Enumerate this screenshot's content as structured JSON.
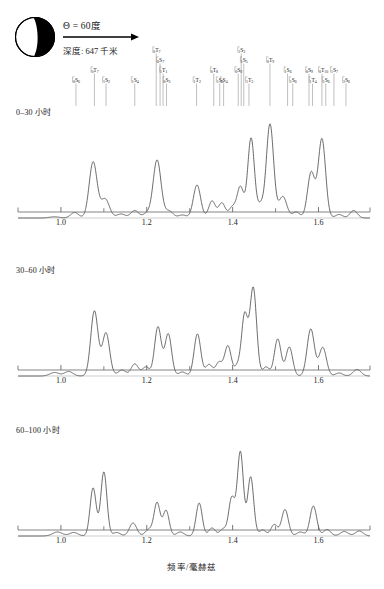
{
  "header": {
    "theta_label": "Θ = 60度",
    "depth_label": "深度: 647 千米",
    "beachball_name": "focal-mechanism-beachball"
  },
  "axis": {
    "xlabel": "频率/毫赫兹",
    "ticks_major": [
      "1.0",
      "1.2",
      "1.4",
      "1.6"
    ],
    "tick_values_major": [
      1.0,
      1.2,
      1.4,
      1.6
    ],
    "tick_values_minor": [
      1.1,
      1.3,
      1.5
    ],
    "xmin": 0.9,
    "xmax": 1.72
  },
  "panels": [
    {
      "label": "0–30 小时"
    },
    {
      "label": "30–60 小时"
    },
    {
      "label": "60–100 小时"
    }
  ],
  "mode_labels": [
    {
      "text": "0S6",
      "n": "0",
      "type": "S",
      "l": "6",
      "freq": 1.035,
      "tier": 0
    },
    {
      "text": "0T7",
      "n": "0",
      "type": "T",
      "l": "7",
      "freq": 1.078,
      "tier": 1
    },
    {
      "text": "1S2",
      "n": "1",
      "type": "S",
      "l": "2",
      "freq": 1.105,
      "tier": 0
    },
    {
      "text": "1S4",
      "n": "1",
      "type": "S",
      "l": "4",
      "freq": 1.172,
      "tier": 0
    },
    {
      "text": "0T7",
      "n": "0",
      "type": "T",
      "l": "7",
      "freq": 1.222,
      "tier": 3
    },
    {
      "text": "0S7",
      "n": "0",
      "type": "S",
      "l": "7",
      "freq": 1.231,
      "tier": 2
    },
    {
      "text": "1T1",
      "n": "1",
      "type": "T",
      "l": "1",
      "freq": 1.238,
      "tier": 1
    },
    {
      "text": "0S3",
      "n": "0",
      "type": "S",
      "l": "3",
      "freq": 1.246,
      "tier": 0
    },
    {
      "text": "1T2",
      "n": "1",
      "type": "T",
      "l": "2",
      "freq": 1.316,
      "tier": 0
    },
    {
      "text": "0T8",
      "n": "0",
      "type": "T",
      "l": "8",
      "freq": 1.356,
      "tier": 1
    },
    {
      "text": "1S5",
      "n": "1",
      "type": "S",
      "l": "5",
      "freq": 1.37,
      "tier": 0
    },
    {
      "text": "2S4",
      "n": "2",
      "type": "S",
      "l": "4",
      "freq": 1.379,
      "tier": 0
    },
    {
      "text": "0S8",
      "n": "0",
      "type": "S",
      "l": "8",
      "freq": 1.413,
      "tier": 1
    },
    {
      "text": "1S3",
      "n": "1",
      "type": "S",
      "l": "3",
      "freq": 1.42,
      "tier": 3
    },
    {
      "text": "1S5",
      "n": "1",
      "type": "S",
      "l": "5",
      "freq": 1.426,
      "tier": 2
    },
    {
      "text": "1T3",
      "n": "1",
      "type": "T",
      "l": "3",
      "freq": 1.438,
      "tier": 0
    },
    {
      "text": "0T9",
      "n": "0",
      "type": "T",
      "l": "9",
      "freq": 1.487,
      "tier": 2
    },
    {
      "text": "1S6",
      "n": "1",
      "type": "S",
      "l": "6",
      "freq": 1.528,
      "tier": 1
    },
    {
      "text": "1S6",
      "n": "1",
      "type": "S",
      "l": "6",
      "freq": 1.54,
      "tier": 0
    },
    {
      "text": "0S9",
      "n": "0",
      "type": "S",
      "l": "9",
      "freq": 1.578,
      "tier": 1
    },
    {
      "text": "1T4",
      "n": "1",
      "type": "T",
      "l": "4",
      "freq": 1.586,
      "tier": 0
    },
    {
      "text": "0T10",
      "n": "0",
      "type": "T",
      "l": "10",
      "freq": 1.608,
      "tier": 1
    },
    {
      "text": "1S6",
      "n": "1",
      "type": "S",
      "l": "6",
      "freq": 1.617,
      "tier": 0
    },
    {
      "text": "1S7",
      "n": "1",
      "type": "S",
      "l": "7",
      "freq": 1.636,
      "tier": 1
    },
    {
      "text": "2S6",
      "n": "2",
      "type": "S",
      "l": "6",
      "freq": 1.664,
      "tier": 0
    }
  ],
  "chart_data": {
    "type": "line",
    "title": "",
    "xlabel": "频率/毫赫兹",
    "ylabel": "",
    "xlim": [
      0.9,
      1.72
    ],
    "ylim": [
      0,
      1.0
    ],
    "grid": false,
    "legend": "none",
    "series": [
      {
        "name": "0–30 小时",
        "peaks": [
          {
            "f": 0.985,
            "a": 0.012,
            "w": 0.016
          },
          {
            "f": 1.032,
            "a": 0.055,
            "w": 0.013
          },
          {
            "f": 1.075,
            "a": 0.56,
            "w": 0.013
          },
          {
            "f": 1.103,
            "a": 0.19,
            "w": 0.014
          },
          {
            "f": 1.14,
            "a": 0.04,
            "w": 0.014
          },
          {
            "f": 1.172,
            "a": 0.075,
            "w": 0.013
          },
          {
            "f": 1.2,
            "a": 0.045,
            "w": 0.012
          },
          {
            "f": 1.224,
            "a": 0.58,
            "w": 0.013
          },
          {
            "f": 1.252,
            "a": 0.07,
            "w": 0.013
          },
          {
            "f": 1.283,
            "a": 0.03,
            "w": 0.013
          },
          {
            "f": 1.317,
            "a": 0.33,
            "w": 0.012
          },
          {
            "f": 1.352,
            "a": 0.17,
            "w": 0.011
          },
          {
            "f": 1.375,
            "a": 0.15,
            "w": 0.011
          },
          {
            "f": 1.399,
            "a": 0.105,
            "w": 0.011
          },
          {
            "f": 1.418,
            "a": 0.31,
            "w": 0.011
          },
          {
            "f": 1.443,
            "a": 0.8,
            "w": 0.011
          },
          {
            "f": 1.465,
            "a": 0.12,
            "w": 0.01
          },
          {
            "f": 1.487,
            "a": 0.94,
            "w": 0.012
          },
          {
            "f": 1.517,
            "a": 0.215,
            "w": 0.013
          },
          {
            "f": 1.548,
            "a": 0.06,
            "w": 0.012
          },
          {
            "f": 1.583,
            "a": 0.455,
            "w": 0.012
          },
          {
            "f": 1.608,
            "a": 0.79,
            "w": 0.012
          },
          {
            "f": 1.648,
            "a": 0.035,
            "w": 0.012
          },
          {
            "f": 1.682,
            "a": 0.075,
            "w": 0.012
          }
        ]
      },
      {
        "name": "30–60 小时",
        "peaks": [
          {
            "f": 0.985,
            "a": 0.035,
            "w": 0.015
          },
          {
            "f": 1.018,
            "a": 0.045,
            "w": 0.014
          },
          {
            "f": 1.078,
            "a": 0.65,
            "w": 0.012
          },
          {
            "f": 1.105,
            "a": 0.43,
            "w": 0.012
          },
          {
            "f": 1.142,
            "a": 0.06,
            "w": 0.013
          },
          {
            "f": 1.172,
            "a": 0.12,
            "w": 0.012
          },
          {
            "f": 1.198,
            "a": 0.09,
            "w": 0.012
          },
          {
            "f": 1.226,
            "a": 0.49,
            "w": 0.011
          },
          {
            "f": 1.25,
            "a": 0.42,
            "w": 0.011
          },
          {
            "f": 1.283,
            "a": 0.04,
            "w": 0.012
          },
          {
            "f": 1.318,
            "a": 0.42,
            "w": 0.011
          },
          {
            "f": 1.345,
            "a": 0.115,
            "w": 0.011
          },
          {
            "f": 1.368,
            "a": 0.135,
            "w": 0.011
          },
          {
            "f": 1.389,
            "a": 0.3,
            "w": 0.011
          },
          {
            "f": 1.412,
            "a": 0.1,
            "w": 0.01
          },
          {
            "f": 1.428,
            "a": 0.6,
            "w": 0.01
          },
          {
            "f": 1.448,
            "a": 0.88,
            "w": 0.011
          },
          {
            "f": 1.478,
            "a": 0.09,
            "w": 0.011
          },
          {
            "f": 1.505,
            "a": 0.37,
            "w": 0.011
          },
          {
            "f": 1.532,
            "a": 0.29,
            "w": 0.011
          },
          {
            "f": 1.582,
            "a": 0.47,
            "w": 0.012
          },
          {
            "f": 1.61,
            "a": 0.285,
            "w": 0.012
          },
          {
            "f": 1.648,
            "a": 0.03,
            "w": 0.012
          },
          {
            "f": 1.69,
            "a": 0.065,
            "w": 0.013
          }
        ]
      },
      {
        "name": "60–100 小时",
        "peaks": [
          {
            "f": 0.992,
            "a": 0.04,
            "w": 0.016
          },
          {
            "f": 1.03,
            "a": 0.035,
            "w": 0.014
          },
          {
            "f": 1.075,
            "a": 0.48,
            "w": 0.01
          },
          {
            "f": 1.1,
            "a": 0.64,
            "w": 0.01
          },
          {
            "f": 1.13,
            "a": 0.035,
            "w": 0.012
          },
          {
            "f": 1.168,
            "a": 0.13,
            "w": 0.012
          },
          {
            "f": 1.205,
            "a": 0.065,
            "w": 0.012
          },
          {
            "f": 1.224,
            "a": 0.33,
            "w": 0.01
          },
          {
            "f": 1.245,
            "a": 0.255,
            "w": 0.01
          },
          {
            "f": 1.278,
            "a": 0.04,
            "w": 0.012
          },
          {
            "f": 1.322,
            "a": 0.33,
            "w": 0.01
          },
          {
            "f": 1.352,
            "a": 0.08,
            "w": 0.011
          },
          {
            "f": 1.378,
            "a": 0.07,
            "w": 0.011
          },
          {
            "f": 1.398,
            "a": 0.38,
            "w": 0.01
          },
          {
            "f": 1.418,
            "a": 0.84,
            "w": 0.01
          },
          {
            "f": 1.442,
            "a": 0.59,
            "w": 0.01
          },
          {
            "f": 1.47,
            "a": 0.06,
            "w": 0.011
          },
          {
            "f": 1.497,
            "a": 0.115,
            "w": 0.011
          },
          {
            "f": 1.522,
            "a": 0.265,
            "w": 0.011
          },
          {
            "f": 1.558,
            "a": 0.04,
            "w": 0.012
          },
          {
            "f": 1.588,
            "a": 0.3,
            "w": 0.011
          },
          {
            "f": 1.62,
            "a": 0.065,
            "w": 0.012
          },
          {
            "f": 1.66,
            "a": 0.045,
            "w": 0.013
          },
          {
            "f": 1.695,
            "a": 0.05,
            "w": 0.013
          }
        ]
      }
    ]
  }
}
